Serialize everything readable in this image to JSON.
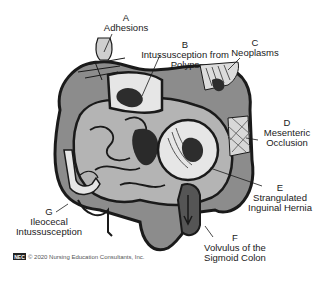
{
  "figure": {
    "labels": [
      {
        "letter": "A",
        "text": "Adhesions"
      },
      {
        "letter": "B",
        "text": "Intussusception from Polyps"
      },
      {
        "letter": "C",
        "text": "Neoplasms"
      },
      {
        "letter": "D",
        "text": "Mesenteric Occlusion"
      },
      {
        "letter": "E",
        "text": "Strangulated Inguinal Hernia"
      },
      {
        "letter": "F",
        "text": "Volvulus of the Sigmoid Colon"
      },
      {
        "letter": "G",
        "text": "Ileocecal Intussusception"
      }
    ],
    "label_lines": {
      "B1": "Intussusception from",
      "B2": "Polyps",
      "D1": "Mesenteric",
      "D2": "Occlusion",
      "E1": "Strangulated",
      "E2": "Inguinal Hernia",
      "F1": "Volvulus of the",
      "F2": "Sigmoid Colon",
      "G1": "Ileocecal",
      "G2": "Intussusception"
    }
  },
  "footer": {
    "logo": "NEC",
    "copyright": "© 2020 Nursing Education Consultants, Inc."
  },
  "colors": {
    "colon": "#8c8c8c",
    "small_intestine": "#b4b4b4",
    "outline": "#1a1a1a",
    "light": "#dcdcdc",
    "dark": "#3c3c3c"
  }
}
